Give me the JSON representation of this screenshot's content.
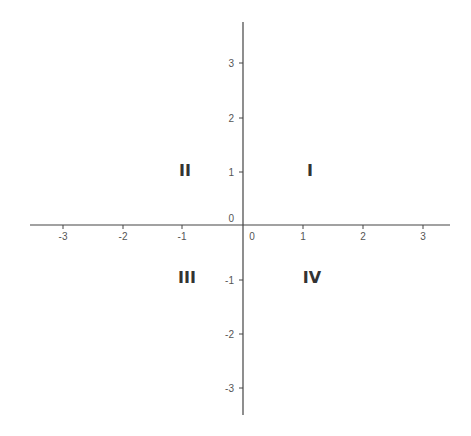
{
  "diagram": {
    "type": "coordinate-plane",
    "colors": {
      "axis": "#444444",
      "tick_label": "#555555",
      "quadrant_label": "#333333",
      "background": "#ffffff"
    },
    "x_axis": {
      "ticks": [
        {
          "value": -3,
          "label": "-3"
        },
        {
          "value": -2,
          "label": "-2"
        },
        {
          "value": -1,
          "label": "-1"
        },
        {
          "value": 0,
          "label": "0"
        },
        {
          "value": 1,
          "label": "1"
        },
        {
          "value": 2,
          "label": "2"
        },
        {
          "value": 3,
          "label": "3"
        }
      ]
    },
    "y_axis": {
      "ticks": [
        {
          "value": 3,
          "label": "3"
        },
        {
          "value": 2,
          "label": "2"
        },
        {
          "value": 1,
          "label": "1"
        },
        {
          "value": 0,
          "label": "0"
        },
        {
          "value": -1,
          "label": "-1"
        },
        {
          "value": -2,
          "label": "-2"
        },
        {
          "value": -3,
          "label": "-3"
        }
      ]
    },
    "quadrants": {
      "q1": "I",
      "q2": "II",
      "q3": "III",
      "q4": "IV"
    }
  }
}
